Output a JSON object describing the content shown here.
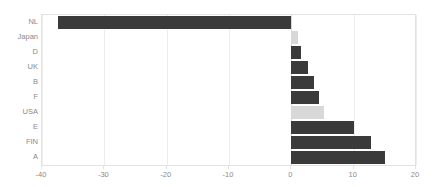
{
  "chart_data": {
    "type": "bar",
    "orientation": "horizontal",
    "title": "",
    "subtitle": "",
    "xlabel": "",
    "ylabel": "",
    "xlim": [
      -40,
      20
    ],
    "ylim": null,
    "grid": true,
    "legend": null,
    "legend_position": "none",
    "xticks": [
      -40,
      -30,
      -20,
      -10,
      0,
      10,
      20
    ],
    "xtick_labels": [
      "-40",
      "-30",
      "-20",
      "-10",
      "0",
      "10",
      "20"
    ],
    "categories": [
      "NL",
      "Japan",
      "D",
      "UK",
      "B",
      "F",
      "USA",
      "E",
      "FIN",
      "A"
    ],
    "values": [
      -37.5,
      1.0,
      1.6,
      2.6,
      3.6,
      4.4,
      5.3,
      10.0,
      12.8,
      15.1
    ],
    "colors": [
      "#3a3a3a",
      "#d8d8d8",
      "#3a3a3a",
      "#3a3a3a",
      "#3a3a3a",
      "#3a3a3a",
      "#d8d8d8",
      "#3a3a3a",
      "#3a3a3a",
      "#3a3a3a"
    ],
    "series": [
      {
        "name": "",
        "values": [
          -37.5,
          1.0,
          1.6,
          2.6,
          3.6,
          4.4,
          5.3,
          10.0,
          12.8,
          15.1
        ]
      }
    ]
  },
  "style": {
    "bar_dark": "#3a3a3a",
    "bar_light": "#d8d8d8",
    "gridline": "#ededed",
    "zeroline": "#d9d9d9",
    "frame": "#e2e2e2",
    "label_color": "#8a8a8a",
    "background": "#ffffff"
  }
}
